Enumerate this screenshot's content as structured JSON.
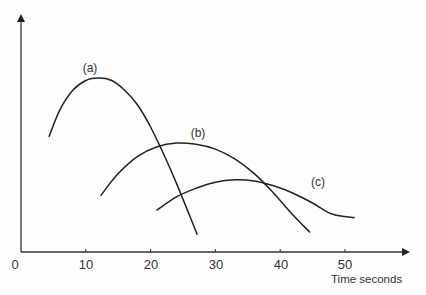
{
  "chart_data": {
    "type": "line",
    "title": "",
    "xlabel": "Time seconds",
    "ylabel": "",
    "xlim": [
      0,
      60
    ],
    "x_ticks": [
      0,
      10,
      20,
      30,
      40,
      50
    ],
    "x_tick_labels": [
      "0",
      "10",
      "20",
      "30",
      "40",
      "50"
    ],
    "y_ticks": [],
    "grid": false,
    "legend": "inline labels",
    "series": [
      {
        "name": "(a)",
        "points": [
          [
            4.3,
            0.47
          ],
          [
            6,
            0.58
          ],
          [
            8,
            0.66
          ],
          [
            10,
            0.7
          ],
          [
            12,
            0.71
          ],
          [
            14,
            0.7
          ],
          [
            16,
            0.66
          ],
          [
            18,
            0.6
          ],
          [
            20,
            0.51
          ],
          [
            22,
            0.4
          ],
          [
            24,
            0.28
          ],
          [
            26,
            0.15
          ],
          [
            27.2,
            0.07
          ]
        ]
      },
      {
        "name": "(b)",
        "points": [
          [
            12.3,
            0.23
          ],
          [
            15,
            0.32
          ],
          [
            18,
            0.39
          ],
          [
            21,
            0.43
          ],
          [
            24,
            0.445
          ],
          [
            27,
            0.44
          ],
          [
            30,
            0.42
          ],
          [
            33,
            0.38
          ],
          [
            36,
            0.32
          ],
          [
            39,
            0.24
          ],
          [
            42,
            0.15
          ],
          [
            44.6,
            0.08
          ]
        ]
      },
      {
        "name": "(c)",
        "points": [
          [
            20.9,
            0.17
          ],
          [
            24,
            0.225
          ],
          [
            27,
            0.26
          ],
          [
            30,
            0.285
          ],
          [
            33,
            0.295
          ],
          [
            36,
            0.29
          ],
          [
            39,
            0.27
          ],
          [
            42,
            0.24
          ],
          [
            45,
            0.2
          ],
          [
            48,
            0.155
          ],
          [
            51.5,
            0.14
          ]
        ]
      }
    ]
  },
  "labels": {
    "x0": "0",
    "x10": "10",
    "x20": "20",
    "x30": "30",
    "x40": "40",
    "x50": "50",
    "xlabel": "Time seconds",
    "a": "(a)",
    "b": "(b)",
    "c": "(c)"
  }
}
